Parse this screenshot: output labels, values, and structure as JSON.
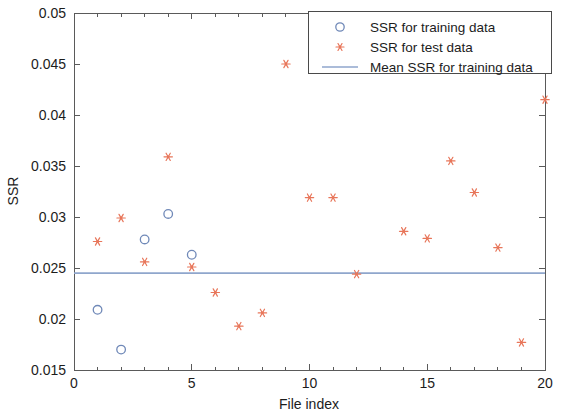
{
  "chart_data": {
    "type": "scatter",
    "title": "",
    "xlabel": "File index",
    "ylabel": "SSR",
    "xlim": [
      0,
      20
    ],
    "ylim": [
      0.015,
      0.05
    ],
    "xticks": [
      0,
      5,
      10,
      15,
      20
    ],
    "xtick_labels": [
      "0",
      "5",
      "10",
      "15",
      "20"
    ],
    "xminor_ticks": [
      1,
      2,
      3,
      4,
      6,
      7,
      8,
      9,
      11,
      12,
      13,
      14,
      16,
      17,
      18,
      19
    ],
    "yticks": [
      0.015,
      0.02,
      0.025,
      0.03,
      0.035,
      0.04,
      0.045,
      0.05
    ],
    "ytick_labels": [
      "0.015",
      "0.02",
      "0.025",
      "0.03",
      "0.035",
      "0.04",
      "0.045",
      "0.05"
    ],
    "grid": false,
    "legend_position": "top-right",
    "series": [
      {
        "name": "SSR for training data",
        "marker": "open-circle",
        "color": "#7089b8",
        "x": [
          1,
          2,
          3,
          4,
          5
        ],
        "y": [
          0.0209,
          0.017,
          0.0278,
          0.0303,
          0.0263
        ]
      },
      {
        "name": "SSR for test data",
        "marker": "asterisk",
        "color": "#e8765a",
        "x": [
          1,
          2,
          3,
          4,
          5,
          6,
          7,
          8,
          9,
          10,
          11,
          12,
          14,
          15,
          16,
          17,
          18,
          19,
          20
        ],
        "y": [
          0.0276,
          0.0299,
          0.0256,
          0.0359,
          0.0251,
          0.0226,
          0.0193,
          0.0206,
          0.045,
          0.0319,
          0.0319,
          0.0244,
          0.0286,
          0.0279,
          0.0355,
          0.0324,
          0.027,
          0.0177,
          0.0415
        ]
      },
      {
        "name": "Mean SSR for training data",
        "marker": "line",
        "color": "#8fa6cc",
        "value": 0.0245
      }
    ],
    "legend_entries": [
      {
        "label": "SSR for training data",
        "marker": "open-circle",
        "color": "#7089b8"
      },
      {
        "label": "SSR for test data",
        "marker": "asterisk",
        "color": "#e8765a"
      },
      {
        "label": "Mean SSR for training data",
        "marker": "line",
        "color": "#8fa6cc"
      }
    ]
  },
  "colors": {
    "training": "#7089b8",
    "test": "#e8765a",
    "mean_line": "#8fa6cc",
    "axis": "#5a5a5a",
    "text": "#1c1c1c",
    "background": "#ffffff"
  }
}
